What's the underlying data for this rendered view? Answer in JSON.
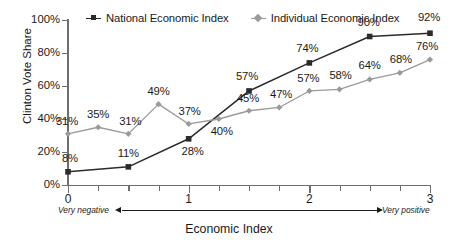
{
  "chart_data": {
    "type": "line",
    "title": "",
    "xlabel": "Economic Index",
    "ylabel": "Clinton Vote Share",
    "xlim": [
      0,
      3
    ],
    "ylim": [
      0,
      100
    ],
    "grid": false,
    "legend_position": "top",
    "x_tick_labels": [
      "0",
      "1",
      "2",
      "3"
    ],
    "x_tick_values": [
      0,
      1,
      2,
      3
    ],
    "x_minor_tick_values": [
      0.25,
      0.5,
      0.75,
      1.25,
      1.5,
      1.75,
      2.25,
      2.5,
      2.75
    ],
    "y_tick_labels": [
      "0%",
      "20%",
      "40%",
      "60%",
      "80%",
      "100%"
    ],
    "y_tick_values": [
      0,
      20,
      40,
      60,
      80,
      100
    ],
    "annotations": {
      "axis_low": "Very negative",
      "axis_high": "Very positive"
    },
    "series": [
      {
        "name": "National Economic Index",
        "color": "#2b2b2b",
        "marker": "square",
        "x": [
          0,
          0.5,
          1,
          1.5,
          2,
          2.5,
          3
        ],
        "values": [
          8,
          11,
          28,
          57,
          74,
          90,
          92
        ],
        "labels": [
          "8%",
          "11%",
          "28%",
          "57%",
          "74%",
          "90%",
          "92%"
        ]
      },
      {
        "name": "Individual Economic Index",
        "color": "#9a9a9a",
        "marker": "diamond",
        "x": [
          0,
          0.25,
          0.5,
          0.75,
          1,
          1.25,
          1.5,
          1.75,
          2,
          2.25,
          2.5,
          2.75,
          3
        ],
        "values": [
          31,
          35,
          31,
          49,
          37,
          40,
          45,
          47,
          57,
          58,
          64,
          68,
          76
        ],
        "labels": [
          "31%",
          "35%",
          "31%",
          "49%",
          "37%",
          "40%",
          "45%",
          "47%",
          "57%",
          "58%",
          "64%",
          "68%",
          "76%"
        ]
      }
    ]
  },
  "legend": {
    "entries": [
      {
        "label": "National Economic Index"
      },
      {
        "label": "Individual Economic Index"
      }
    ]
  },
  "colors": {
    "national": "#2b2b2b",
    "individual": "#9a9a9a",
    "axis": "#6e6e6e",
    "text": "#1a1a1a",
    "background": "#ffffff"
  }
}
